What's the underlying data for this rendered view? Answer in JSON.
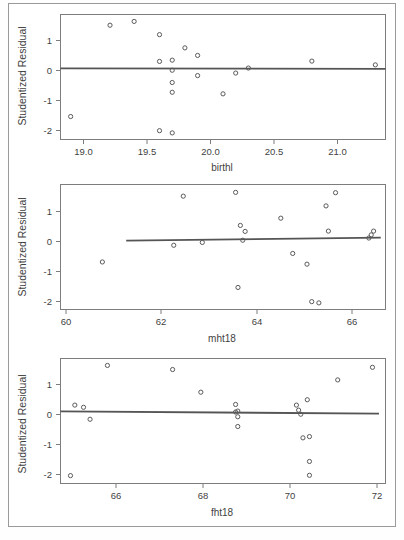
{
  "figure": {
    "title": "",
    "panel_count": 3,
    "frame_color": "#9a9a9a",
    "background": "#ffffff"
  },
  "chart_data": [
    {
      "type": "scatter",
      "title": "",
      "xlabel": "birthl",
      "ylabel": "Studentized Residual",
      "xlim": [
        18.82,
        21.38
      ],
      "ylim": [
        -2.25,
        1.72
      ],
      "xticks": [
        19.0,
        19.5,
        20.0,
        20.5,
        21.0
      ],
      "xticklabels": [
        "19.0",
        "19.5",
        "20.0",
        "20.5",
        "21.0"
      ],
      "yticks": [
        1,
        0,
        -1,
        -2
      ],
      "yticklabels": [
        "1",
        "0",
        "-1",
        "-2"
      ],
      "grid": false,
      "legend": "none",
      "marker": "open-circle",
      "x": [
        18.9,
        19.21,
        19.4,
        19.6,
        19.6,
        19.7,
        19.7,
        19.7,
        19.7,
        19.7,
        19.8,
        19.9,
        19.9,
        20.1,
        20.2,
        20.3,
        20.8,
        21.3
      ],
      "y": [
        -1.52,
        1.38,
        1.5,
        1.08,
        0.23,
        0.27,
        -0.05,
        -0.44,
        -0.75,
        -2.04,
        0.66,
        0.42,
        -0.22,
        -0.8,
        -0.14,
        0.02,
        0.24,
        0.12
      ],
      "extra_points": [
        {
          "x": 19.6,
          "y": -1.97
        }
      ],
      "fit_line": {
        "x0": 18.82,
        "y0": 0.01,
        "x1": 21.38,
        "y1": -0.01
      }
    },
    {
      "type": "scatter",
      "title": "",
      "xlabel": "mht18",
      "ylabel": "Studentized Residual",
      "xlim": [
        59.62,
        66.45
      ],
      "ylim": [
        -2.25,
        1.72
      ],
      "xticks": [
        60,
        62,
        64,
        66
      ],
      "xticklabels": [
        "60",
        "62",
        "64",
        "66"
      ],
      "yticks": [
        1,
        0,
        -1,
        -2
      ],
      "yticklabels": [
        "1",
        "0",
        "-1",
        "-2"
      ],
      "grid": false,
      "legend": "none",
      "marker": "open-circle",
      "x": [
        60.5,
        62.0,
        62.2,
        62.6,
        63.3,
        63.35,
        63.4,
        63.45,
        63.5,
        64.25,
        64.5,
        64.8,
        64.9,
        65.05,
        65.2,
        65.25,
        65.4,
        66.1,
        66.15,
        66.2
      ],
      "y": [
        -0.74,
        -0.21,
        1.35,
        -0.12,
        1.47,
        -1.55,
        0.42,
        -0.05,
        0.23,
        0.65,
        -0.47,
        -0.81,
        -2.0,
        -2.04,
        1.04,
        0.24,
        1.46,
        0.02,
        0.12,
        0.24
      ],
      "fit_line": {
        "x0": 61.0,
        "y0": -0.06,
        "x1": 66.35,
        "y1": 0.03
      }
    },
    {
      "type": "scatter",
      "title": "",
      "xlabel": "fht18",
      "ylabel": "Studentized Residual",
      "xlim": [
        64.72,
        72.2
      ],
      "ylim": [
        -2.25,
        1.72
      ],
      "xticks": [
        66,
        68,
        70,
        72
      ],
      "xticklabels": [
        "66",
        "68",
        "70",
        "72"
      ],
      "yticks": [
        1,
        0,
        -1,
        -2
      ],
      "yticklabels": [
        "1",
        "0",
        "-1",
        "-2"
      ],
      "grid": false,
      "legend": "none",
      "marker": "open-circle",
      "x": [
        64.95,
        65.05,
        65.25,
        65.4,
        65.8,
        67.3,
        67.95,
        68.75,
        68.8,
        68.8,
        68.8,
        68.75,
        70.15,
        70.2,
        70.25,
        70.3,
        70.4,
        70.45,
        70.45,
        70.45,
        71.1,
        71.9
      ],
      "y": [
        -2.0,
        0.24,
        0.17,
        -0.21,
        1.5,
        1.37,
        0.65,
        0.26,
        0.05,
        -0.13,
        -0.44,
        0.02,
        0.24,
        0.08,
        -0.05,
        -0.8,
        0.41,
        -0.76,
        -1.55,
        -1.99,
        1.04,
        1.44
      ],
      "fit_line": {
        "x0": 64.72,
        "y0": 0.04,
        "x1": 72.05,
        "y1": -0.03
      }
    }
  ],
  "panels": [
    {
      "name": "panel-birthl",
      "ylabel": "Studentized Residual",
      "xlabel": "birthl",
      "yticklabels": [
        "1",
        "0",
        "-1",
        "-2"
      ],
      "xticklabels": [
        "19.0",
        "19.5",
        "20.0",
        "20.5",
        "21.0"
      ]
    },
    {
      "name": "panel-mht18",
      "ylabel": "Studentized Residual",
      "xlabel": "mht18",
      "yticklabels": [
        "1",
        "0",
        "-1",
        "-2"
      ],
      "xticklabels": [
        "60",
        "62",
        "64",
        "66"
      ]
    },
    {
      "name": "panel-fht18",
      "ylabel": "Studentized Residual",
      "xlabel": "fht18",
      "yticklabels": [
        "1",
        "0",
        "-1",
        "-2"
      ],
      "xticklabels": [
        "66",
        "68",
        "70",
        "72"
      ]
    }
  ]
}
